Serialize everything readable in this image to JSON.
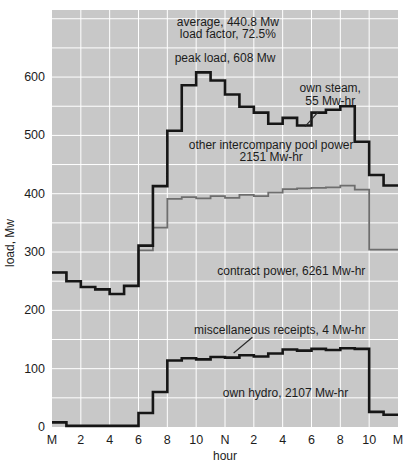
{
  "chart_data": {
    "type": "line",
    "step": true,
    "title": "",
    "xlabel": "hour",
    "ylabel": "load, Mw",
    "xlim": [
      0,
      24
    ],
    "ylim": [
      0,
      715
    ],
    "grid": {
      "on": true,
      "color": "#ffffff",
      "x_step_hours": 2,
      "y_step_mw": 50
    },
    "plot_bg": "#c8c8c8",
    "x_ticks": {
      "hours": [
        0,
        2,
        4,
        6,
        8,
        10,
        12,
        14,
        16,
        18,
        20,
        22,
        24
      ],
      "labels": [
        "M",
        "2",
        "4",
        "6",
        "8",
        "10",
        "N",
        "2",
        "4",
        "6",
        "8",
        "10",
        "M"
      ]
    },
    "y_ticks": [
      0,
      100,
      200,
      300,
      400,
      500,
      600
    ],
    "x_hours": [
      0,
      1,
      2,
      3,
      4,
      5,
      6,
      7,
      8,
      9,
      10,
      11,
      12,
      13,
      14,
      15,
      16,
      17,
      18,
      19,
      20,
      21,
      22,
      23
    ],
    "series": [
      {
        "id": "pool-power-boundary",
        "name": "other intercompany pool power boundary",
        "color": "#6e6e6e",
        "width": 1.8,
        "values": [
          265,
          250,
          240,
          236,
          228,
          242,
          303,
          342,
          391,
          394,
          392,
          396,
          393,
          398,
          396,
          402,
          408,
          409,
          410,
          411,
          414,
          407,
          304,
          304
        ]
      },
      {
        "id": "total-load",
        "name": "total load",
        "color": "#161616",
        "width": 2.6,
        "values": [
          265,
          250,
          240,
          236,
          228,
          242,
          311,
          413,
          508,
          586,
          608,
          594,
          570,
          549,
          539,
          520,
          530,
          517,
          539,
          544,
          550,
          489,
          432,
          414
        ]
      },
      {
        "id": "own-hydro",
        "name": "own hydro",
        "color": "#161616",
        "width": 2.6,
        "values": [
          8,
          2,
          2,
          2,
          2,
          2,
          24,
          60,
          114,
          118,
          116,
          120,
          119,
          123,
          121,
          126,
          133,
          131,
          134,
          132,
          135,
          134,
          26,
          21
        ]
      }
    ],
    "annotations": [
      {
        "id": "average",
        "lines": [
          "average, 440.8 Mw",
          "load factor, 72.5%"
        ],
        "x_hour": 12.2,
        "y_mw": 688,
        "anchor": "middle"
      },
      {
        "id": "peak-load",
        "lines": [
          "peak load, 608 Mw"
        ],
        "x_hour": 12.0,
        "y_mw": 626,
        "anchor": "middle"
      },
      {
        "id": "own-steam",
        "lines": [
          "own steam,",
          "55 Mw-hr"
        ],
        "x_hour": 19.3,
        "y_mw": 574,
        "anchor": "middle",
        "leader": {
          "from": [
            18.45,
            540
          ],
          "to": [
            17.55,
            515
          ]
        }
      },
      {
        "id": "pool-power",
        "lines": [
          "other intercompany pool power",
          "2151 Mw-hr"
        ],
        "x_hour": 15.2,
        "y_mw": 477,
        "anchor": "middle"
      },
      {
        "id": "contract-power",
        "lines": [
          "contract power, 6261 Mw-hr"
        ],
        "x_hour": 16.6,
        "y_mw": 261,
        "anchor": "middle"
      },
      {
        "id": "misc-receipts",
        "lines": [
          "miscellaneous receipts, 4 Mw-hr"
        ],
        "x_hour": 15.8,
        "y_mw": 159,
        "anchor": "middle",
        "leader": {
          "from": [
            13.9,
            154
          ],
          "to": [
            12.6,
            127
          ]
        }
      },
      {
        "id": "own-hydro",
        "lines": [
          "own hydro, 2107 Mw-hr"
        ],
        "x_hour": 16.2,
        "y_mw": 51,
        "anchor": "middle"
      }
    ],
    "fonts": {
      "tick_size": 12.5,
      "annotation_size": 12,
      "axis_label_size": 12
    },
    "text_color": "#1c1c1c",
    "leader_color": "#2a2a2a"
  }
}
